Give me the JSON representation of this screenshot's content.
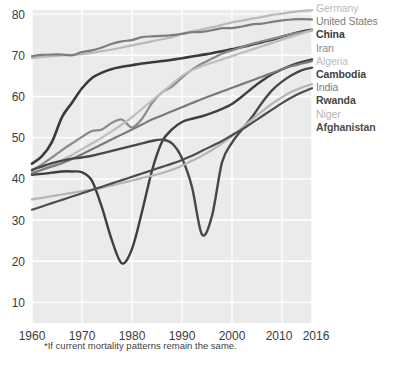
{
  "footnote": "*If current mortality patterns remain the same.",
  "legend": {
    "position": "right",
    "items": [
      {
        "label": "Germany",
        "color": "#b9b9b9",
        "bold": false
      },
      {
        "label": "United States",
        "color": "#7d7d7d",
        "bold": false
      },
      {
        "label": "China",
        "color": "#3a3a3a",
        "bold": true
      },
      {
        "label": "Iran",
        "color": "#8a8a8a",
        "bold": false
      },
      {
        "label": "Algeria",
        "color": "#bdbdbd",
        "bold": false
      },
      {
        "label": "Cambodia",
        "color": "#3f3f3f",
        "bold": true
      },
      {
        "label": "India",
        "color": "#7a7a7a",
        "bold": false
      },
      {
        "label": "Rwanda",
        "color": "#484848",
        "bold": true
      },
      {
        "label": "Niger",
        "color": "#b5b5b5",
        "bold": false
      },
      {
        "label": "Afghanistan",
        "color": "#4d4d4d",
        "bold": true
      }
    ]
  },
  "chart_data": {
    "type": "line",
    "title": "",
    "xlabel": "",
    "ylabel": "",
    "xlim": [
      1960,
      2016
    ],
    "ylim": [
      5,
      81
    ],
    "grid": true,
    "x_ticks": [
      1960,
      1970,
      1980,
      1990,
      2000,
      2010,
      2016
    ],
    "x_tick_labels": [
      "1960",
      "1970",
      "1980",
      "1990",
      "2000",
      "2010",
      "2016"
    ],
    "y_ticks": [
      10,
      20,
      30,
      40,
      50,
      60,
      70,
      80
    ],
    "y_tick_labels": [
      "10",
      "20",
      "30",
      "40",
      "50",
      "60",
      "70",
      "80"
    ],
    "x": [
      1960,
      1962,
      1964,
      1966,
      1968,
      1970,
      1972,
      1974,
      1976,
      1978,
      1980,
      1982,
      1984,
      1986,
      1988,
      1990,
      1992,
      1994,
      1996,
      1998,
      2000,
      2002,
      2004,
      2006,
      2008,
      2010,
      2012,
      2014,
      2016
    ],
    "series": [
      {
        "name": "Germany",
        "color": "#b9b9b9",
        "width": 2.2,
        "values": [
          69.3,
          69.6,
          69.8,
          70.0,
          70.1,
          70.3,
          70.6,
          71.0,
          71.4,
          71.9,
          72.4,
          72.9,
          73.4,
          73.9,
          74.4,
          75.2,
          75.8,
          76.3,
          76.8,
          77.4,
          78.0,
          78.4,
          78.9,
          79.3,
          79.8,
          80.1,
          80.5,
          80.8,
          80.9
        ]
      },
      {
        "name": "United States",
        "color": "#7d7d7d",
        "width": 2.2,
        "values": [
          69.8,
          70.1,
          70.2,
          70.2,
          70.0,
          70.8,
          71.2,
          71.9,
          72.8,
          73.4,
          73.7,
          74.4,
          74.6,
          74.7,
          74.9,
          75.2,
          75.6,
          75.7,
          76.1,
          76.6,
          76.6,
          77.0,
          77.5,
          77.7,
          78.1,
          78.5,
          78.7,
          78.8,
          78.7
        ]
      },
      {
        "name": "China",
        "color": "#3a3a3a",
        "width": 2.6,
        "values": [
          43.7,
          45.5,
          49.0,
          55.0,
          58.5,
          62.0,
          64.5,
          65.8,
          66.7,
          67.2,
          67.6,
          68.0,
          68.3,
          68.6,
          68.9,
          69.3,
          69.7,
          70.1,
          70.5,
          71.0,
          71.5,
          72.0,
          72.6,
          73.2,
          73.8,
          74.5,
          75.2,
          75.8,
          76.2
        ]
      },
      {
        "name": "Iran",
        "color": "#8a8a8a",
        "width": 2.2,
        "values": [
          42.0,
          43.5,
          45.2,
          47.0,
          48.6,
          50.2,
          51.6,
          52.0,
          53.6,
          54.4,
          52.5,
          54.6,
          58.4,
          61.0,
          62.4,
          64.6,
          66.5,
          68.0,
          69.2,
          70.4,
          71.2,
          72.0,
          72.8,
          73.4,
          74.0,
          74.6,
          75.2,
          75.6,
          76.0
        ]
      },
      {
        "name": "Algeria",
        "color": "#bdbdbd",
        "width": 2.2,
        "values": [
          41.0,
          42.2,
          43.4,
          44.6,
          45.8,
          47.2,
          48.6,
          50.0,
          51.6,
          53.2,
          55.0,
          57.0,
          59.0,
          61.0,
          63.0,
          65.0,
          66.4,
          67.4,
          68.2,
          69.0,
          69.8,
          70.6,
          71.4,
          72.2,
          73.0,
          73.8,
          74.6,
          75.3,
          76.1
        ]
      },
      {
        "name": "Cambodia",
        "color": "#3f3f3f",
        "width": 2.4,
        "values": [
          41.0,
          41.2,
          41.5,
          41.8,
          41.8,
          41.6,
          39.5,
          33.0,
          25.0,
          19.5,
          23.0,
          32.0,
          42.0,
          49.0,
          52.0,
          53.8,
          54.6,
          55.2,
          56.0,
          57.0,
          58.2,
          60.0,
          62.0,
          63.8,
          65.4,
          66.6,
          67.6,
          68.4,
          69.0
        ]
      },
      {
        "name": "India",
        "color": "#7a7a7a",
        "width": 2.2,
        "values": [
          41.4,
          42.2,
          43.0,
          43.8,
          44.8,
          46.0,
          47.2,
          48.4,
          49.6,
          50.8,
          52.0,
          53.2,
          54.4,
          55.4,
          56.4,
          57.4,
          58.4,
          59.4,
          60.3,
          61.2,
          62.1,
          63.0,
          63.9,
          64.8,
          65.7,
          66.6,
          67.4,
          68.0,
          68.6
        ]
      },
      {
        "name": "Rwanda",
        "color": "#484848",
        "width": 2.4,
        "values": [
          42.2,
          43.0,
          43.8,
          44.4,
          44.9,
          45.2,
          45.6,
          46.2,
          46.8,
          47.4,
          48.0,
          48.6,
          49.2,
          49.5,
          48.6,
          45.0,
          38.0,
          26.5,
          31.0,
          44.0,
          48.8,
          52.0,
          55.0,
          58.5,
          61.5,
          63.6,
          65.2,
          66.4,
          67.0
        ]
      },
      {
        "name": "Niger",
        "color": "#b5b5b5",
        "width": 2.2,
        "values": [
          35.0,
          35.4,
          35.8,
          36.2,
          36.6,
          37.0,
          37.4,
          37.8,
          38.4,
          39.0,
          39.6,
          40.2,
          40.8,
          41.4,
          42.2,
          43.2,
          44.4,
          45.6,
          47.0,
          48.6,
          50.4,
          52.4,
          54.4,
          56.4,
          58.2,
          59.8,
          61.2,
          62.2,
          63.0
        ]
      },
      {
        "name": "Afghanistan",
        "color": "#4d4d4d",
        "width": 2.2,
        "values": [
          32.5,
          33.3,
          34.1,
          34.9,
          35.7,
          36.5,
          37.3,
          38.1,
          38.9,
          39.7,
          40.5,
          41.3,
          42.1,
          42.9,
          43.7,
          44.6,
          45.6,
          46.8,
          48.0,
          49.2,
          50.6,
          52.0,
          53.6,
          55.2,
          56.8,
          58.4,
          59.8,
          61.0,
          62.0
        ]
      }
    ]
  }
}
